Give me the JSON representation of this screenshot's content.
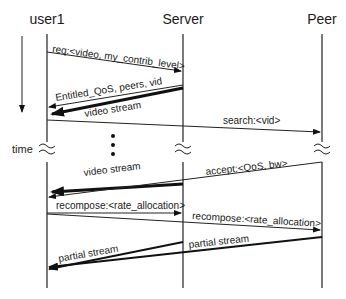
{
  "diagram": {
    "type": "sequence",
    "actors": [
      {
        "id": "user1",
        "label": "user1",
        "x": 47
      },
      {
        "id": "server",
        "label": "Server",
        "x": 183
      },
      {
        "id": "peer",
        "label": "Peer",
        "x": 322
      }
    ],
    "time_axis": {
      "label": "time"
    },
    "ellipsis": "⋮",
    "messages": [
      {
        "id": "m1",
        "from": "user1",
        "to": "server",
        "label": "req:<video, my_contrib_level>",
        "weight": "thin"
      },
      {
        "id": "m2",
        "from": "server",
        "to": "user1",
        "label": "Entitled_QoS, peers, vid",
        "weight": "thin"
      },
      {
        "id": "m3",
        "from": "server",
        "to": "user1",
        "label": "video stream",
        "weight": "thick"
      },
      {
        "id": "m4",
        "from": "user1",
        "to": "peer",
        "label": "search:<vid>",
        "weight": "thin"
      },
      {
        "id": "m5",
        "from": "server",
        "to": "user1",
        "label": "video stream",
        "weight": "thick"
      },
      {
        "id": "m6",
        "from": "peer",
        "to": "user1",
        "label": "accept:<QoS, bw>",
        "weight": "thin"
      },
      {
        "id": "m7",
        "from": "user1",
        "to": "server",
        "label": "recompose:<rate_allocation>",
        "weight": "thin"
      },
      {
        "id": "m8",
        "from": "user1",
        "to": "peer",
        "label": "recompose:<rate_allocation>",
        "weight": "thin"
      },
      {
        "id": "m9",
        "from": "server",
        "to": "user1",
        "label": "partial stream",
        "weight": "medium"
      },
      {
        "id": "m10",
        "from": "peer",
        "to": "user1",
        "label": "partial stream",
        "weight": "medium"
      }
    ]
  }
}
